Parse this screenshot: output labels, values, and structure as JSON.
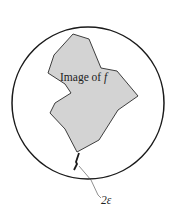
{
  "figure": {
    "region_label": "Image of ",
    "region_label_var": "f",
    "gap_label": "2ε",
    "colors": {
      "stroke": "#1a1a1a",
      "region_fill": "#d3d3d3",
      "background": "#ffffff"
    }
  }
}
